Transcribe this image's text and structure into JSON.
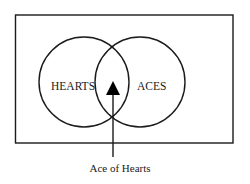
{
  "diagram": {
    "type": "venn",
    "universe": {
      "label": ""
    },
    "sets": [
      {
        "id": "hearts",
        "label": "HEARTS"
      },
      {
        "id": "aces",
        "label": "ACES"
      }
    ],
    "intersection": {
      "marker": "triangle-marker",
      "callout": "Ace of Hearts"
    },
    "colors": {
      "stroke": "#1a1a1a",
      "background": "#ffffff",
      "marker": "#000000"
    }
  }
}
